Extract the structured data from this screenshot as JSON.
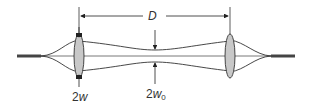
{
  "diagram": {
    "type": "gaussian-beam-fiber-coupling",
    "labels": {
      "distance": "D",
      "beam_width": {
        "coef": "2",
        "var": "w"
      },
      "waist_width": {
        "coef": "2",
        "var": "w",
        "sub": "0"
      }
    },
    "colors": {
      "line": "#333333",
      "lens_fill": "#c8c8c8",
      "fiber": "#444444"
    }
  }
}
